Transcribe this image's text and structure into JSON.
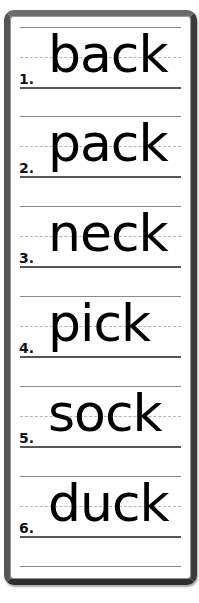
{
  "worksheet": {
    "rows": [
      {
        "number": "1.",
        "word": "back"
      },
      {
        "number": "2.",
        "word": "pack"
      },
      {
        "number": "3.",
        "word": "neck"
      },
      {
        "number": "4.",
        "word": "pick"
      },
      {
        "number": "5.",
        "word": "sock"
      },
      {
        "number": "6.",
        "word": "duck"
      }
    ]
  }
}
